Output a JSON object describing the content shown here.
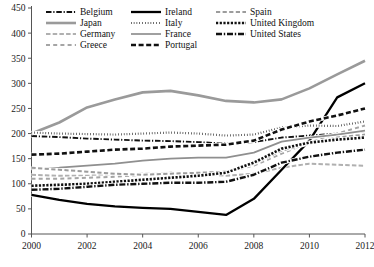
{
  "chart_data": {
    "type": "line",
    "title": "",
    "subtitle": "",
    "xlabel": "",
    "ylabel": "",
    "xlim": [
      2000,
      2012
    ],
    "ylim": [
      0,
      450
    ],
    "grid": false,
    "legend_position": "top",
    "x": [
      2000,
      2001,
      2002,
      2003,
      2004,
      2005,
      2006,
      2007,
      2008,
      2009,
      2010,
      2011,
      2012
    ],
    "xticks": [
      "2000",
      "2002",
      "2004",
      "2006",
      "2008",
      "2010",
      "2012"
    ],
    "yticks": [
      "0",
      "50",
      "100",
      "150",
      "200",
      "250",
      "300",
      "350",
      "400",
      "450"
    ],
    "series": [
      {
        "name": "Belgium",
        "style": "dash-dot",
        "color": "#111111",
        "values": [
          195,
          193,
          190,
          188,
          186,
          185,
          183,
          180,
          183,
          192,
          196,
          200,
          205
        ]
      },
      {
        "name": "Japan",
        "style": "solid-thick-gray",
        "color": "#9a9a9a",
        "values": [
          200,
          222,
          252,
          268,
          282,
          285,
          276,
          265,
          262,
          268,
          290,
          318,
          345
        ]
      },
      {
        "name": "Germany",
        "style": "long-dash-gray",
        "color": "#b0b0b0",
        "values": [
          118,
          116,
          116,
          118,
          120,
          122,
          120,
          116,
          120,
          132,
          140,
          138,
          136
        ]
      },
      {
        "name": "Greece",
        "style": "dash-spaced-gray",
        "color": "#a5a5a5",
        "values": [
          110,
          110,
          112,
          114,
          118,
          122,
          120,
          124,
          136,
          160,
          182,
          200,
          216
        ]
      },
      {
        "name": "Ireland",
        "style": "solid-thick-black",
        "color": "#000000",
        "values": [
          78,
          68,
          60,
          55,
          52,
          50,
          44,
          38,
          70,
          128,
          186,
          272,
          300
        ]
      },
      {
        "name": "Italy",
        "style": "dotted",
        "color": "#111111",
        "values": [
          202,
          200,
          199,
          198,
          200,
          202,
          200,
          196,
          198,
          212,
          216,
          215,
          224
        ]
      },
      {
        "name": "France",
        "style": "solid-gray",
        "color": "#8f8f8f",
        "values": [
          130,
          132,
          136,
          140,
          146,
          150,
          152,
          152,
          162,
          184,
          192,
          198,
          206
        ]
      },
      {
        "name": "Portugal",
        "style": "thick-dash",
        "color": "#111111",
        "values": [
          158,
          160,
          164,
          168,
          170,
          174,
          176,
          178,
          186,
          208,
          224,
          236,
          250
        ]
      },
      {
        "name": "Spain",
        "style": "dash-gray",
        "color": "#9c9c9c",
        "values": [
          132,
          128,
          124,
          120,
          118,
          120,
          122,
          124,
          140,
          166,
          180,
          192,
          198
        ]
      },
      {
        "name": "United Kingdom",
        "style": "square-dot",
        "color": "#111111",
        "values": [
          96,
          98,
          100,
          104,
          108,
          112,
          116,
          122,
          142,
          170,
          182,
          188,
          192
        ]
      },
      {
        "name": "United States",
        "style": "dash-dot-bold",
        "color": "#111111",
        "values": [
          88,
          90,
          94,
          98,
          100,
          102,
          102,
          104,
          118,
          142,
          154,
          162,
          168
        ]
      }
    ]
  },
  "legend": {
    "columns": [
      [
        "Belgium",
        "Japan",
        "Germany",
        "Greece"
      ],
      [
        "Ireland",
        "Italy",
        "France",
        "Portugal"
      ],
      [
        "Spain",
        "United Kingdom",
        "United States"
      ]
    ]
  }
}
